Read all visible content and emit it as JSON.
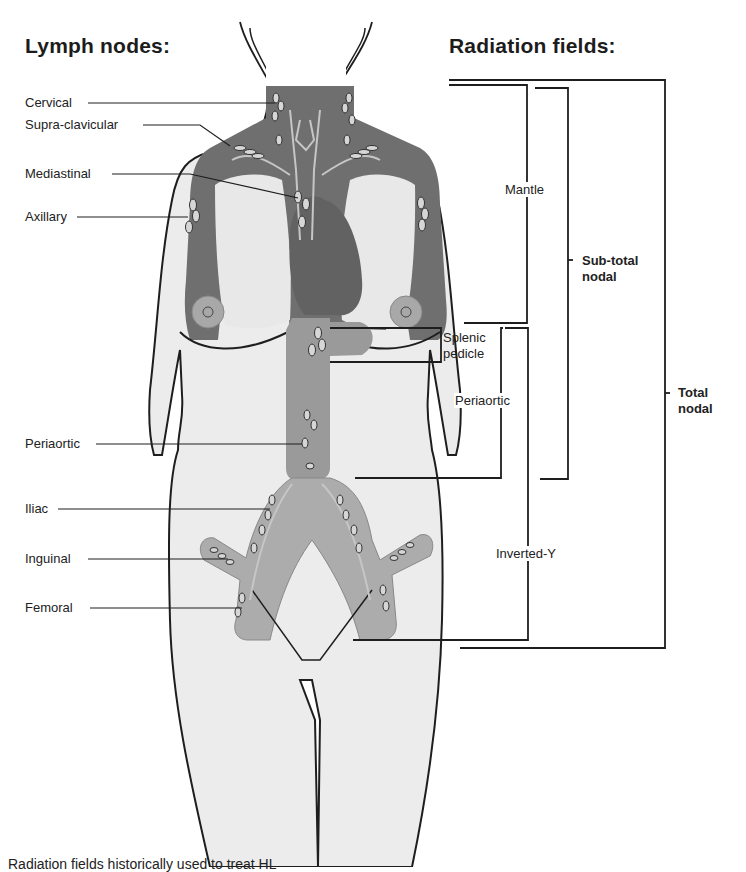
{
  "headings": {
    "lymph_nodes": "Lymph nodes:",
    "radiation_fields": "Radiation fields:"
  },
  "lymph_nodes": [
    {
      "id": "cervical",
      "label": "Cervical",
      "x": 25,
      "y": 94
    },
    {
      "id": "supraclavicular",
      "label": "Supra-clavicular",
      "x": 25,
      "y": 117
    },
    {
      "id": "mediastinal",
      "label": "Mediastinal",
      "x": 25,
      "y": 165
    },
    {
      "id": "axillary",
      "label": "Axillary",
      "x": 25,
      "y": 209
    },
    {
      "id": "periaortic",
      "label": "Periaortic",
      "x": 25,
      "y": 436
    },
    {
      "id": "iliac",
      "label": "Iliac",
      "x": 25,
      "y": 501
    },
    {
      "id": "inguinal",
      "label": "Inguinal",
      "x": 25,
      "y": 551
    },
    {
      "id": "femoral",
      "label": "Femoral",
      "x": 25,
      "y": 599
    }
  ],
  "radiation_fields": [
    {
      "id": "mantle",
      "label": "Mantle"
    },
    {
      "id": "splenic-pedicle",
      "label": "Splenic\npedicle"
    },
    {
      "id": "periaortic",
      "label": "Periaortic"
    },
    {
      "id": "sub-total-nodal",
      "label": "Sub-total\nnodal"
    },
    {
      "id": "inverted-y",
      "label": "Inverted-Y"
    },
    {
      "id": "total-nodal",
      "label": "Total\nnodal"
    }
  ],
  "caption": "Radiation fields historically used to treat HL",
  "colors": {
    "field_dark": "#6e6e6e",
    "field_mid": "#9a9a9a",
    "skin": "#ebebeb",
    "line": "#1e1e1e",
    "vessel": "#c8c8c8"
  }
}
